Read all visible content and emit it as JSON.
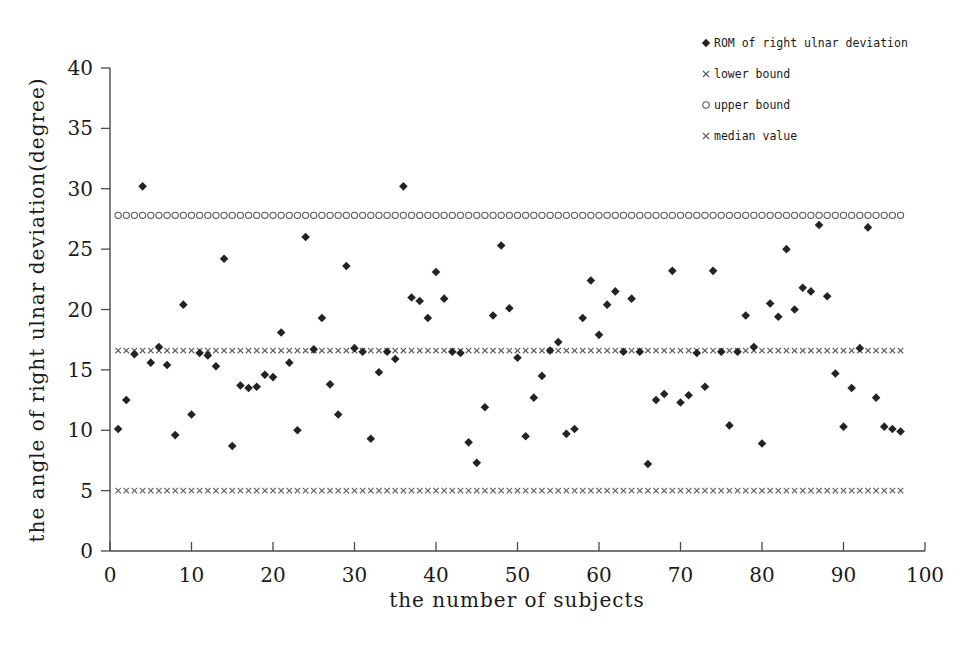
{
  "chart_data": {
    "type": "scatter",
    "title": "",
    "xlabel": "the number of subjects",
    "ylabel": "the angle of right ulnar deviation(degree)",
    "xlim": [
      0,
      100
    ],
    "ylim": [
      0,
      40
    ],
    "xticks": [
      0,
      10,
      20,
      30,
      40,
      50,
      60,
      70,
      80,
      90,
      100
    ],
    "yticks": [
      0,
      5,
      10,
      15,
      20,
      25,
      30,
      35,
      40
    ],
    "grid": false,
    "legend_position": "top-right",
    "legend": [
      {
        "label": "ROM of right ulnar deviation",
        "marker": "diamond"
      },
      {
        "label": "lower bound",
        "marker": "x"
      },
      {
        "label": "upper bound",
        "marker": "circle"
      },
      {
        "label": "median value",
        "marker": "x"
      }
    ],
    "reference_lines": [
      {
        "name": "upper bound",
        "value": 27.8,
        "marker": "circle",
        "x_from": 1,
        "x_to": 97
      },
      {
        "name": "median value",
        "value": 16.6,
        "marker": "x",
        "x_from": 1,
        "x_to": 97
      },
      {
        "name": "lower bound",
        "value": 5.0,
        "marker": "x",
        "x_from": 1,
        "x_to": 97
      }
    ],
    "series": [
      {
        "name": "ROM of right ulnar deviation",
        "marker": "diamond",
        "color": "#232323",
        "x": [
          1,
          2,
          3,
          4,
          5,
          6,
          7,
          8,
          9,
          10,
          11,
          12,
          13,
          14,
          15,
          16,
          17,
          18,
          19,
          20,
          21,
          22,
          23,
          24,
          25,
          26,
          27,
          28,
          29,
          30,
          31,
          32,
          33,
          34,
          35,
          36,
          37,
          38,
          39,
          40,
          41,
          42,
          43,
          44,
          45,
          46,
          47,
          48,
          49,
          50,
          51,
          52,
          53,
          54,
          55,
          56,
          57,
          58,
          59,
          60,
          61,
          62,
          63,
          64,
          65,
          66,
          67,
          68,
          69,
          70,
          71,
          72,
          73,
          74,
          75,
          76,
          77,
          78,
          79,
          80,
          81,
          82,
          83,
          84,
          85,
          86,
          87,
          88,
          89,
          90,
          91,
          92,
          93,
          94,
          95,
          96,
          97
        ],
        "y": [
          10.1,
          12.5,
          16.3,
          30.2,
          15.6,
          16.9,
          15.4,
          9.6,
          20.4,
          11.3,
          16.4,
          16.2,
          15.3,
          24.2,
          8.7,
          13.7,
          13.5,
          13.6,
          14.6,
          14.4,
          18.1,
          15.6,
          10.0,
          26.0,
          16.7,
          19.3,
          13.8,
          11.3,
          23.6,
          16.8,
          16.5,
          9.3,
          14.8,
          16.5,
          15.9,
          30.2,
          21.0,
          20.7,
          19.3,
          23.1,
          20.9,
          16.5,
          16.4,
          9.0,
          7.3,
          11.9,
          19.5,
          25.3,
          20.1,
          16.0,
          9.5,
          12.7,
          14.5,
          16.6,
          17.3,
          9.7,
          10.1,
          19.3,
          22.4,
          17.9,
          20.4,
          21.5,
          16.5,
          20.9,
          16.5,
          7.2,
          12.5,
          13.0,
          23.2,
          12.3,
          12.9,
          16.4,
          13.6,
          23.2,
          16.5,
          10.4,
          16.5,
          19.5,
          16.9,
          8.9,
          20.5,
          19.4,
          25.0,
          20.0,
          21.8,
          21.5,
          27.0,
          21.1,
          14.7,
          10.3,
          13.5,
          16.8,
          26.8,
          12.7,
          10.3,
          10.1,
          9.9
        ]
      }
    ]
  }
}
